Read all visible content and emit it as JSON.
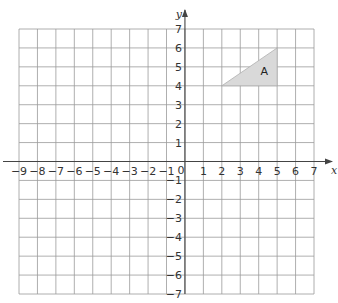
{
  "chart_data": {
    "type": "coordinate-grid",
    "x_axis": {
      "label": "x",
      "min": -9,
      "max": 7,
      "ticks": [
        -9,
        -8,
        -7,
        -6,
        -5,
        -4,
        -3,
        -2,
        -1,
        0,
        1,
        2,
        3,
        4,
        5,
        6,
        7
      ]
    },
    "y_axis": {
      "label": "y",
      "min": -7,
      "max": 7,
      "ticks": [
        -7,
        -6,
        -5,
        -4,
        -3,
        -2,
        -1,
        1,
        2,
        3,
        4,
        5,
        6,
        7
      ]
    },
    "origin_label": "0",
    "grid": true,
    "shapes": [
      {
        "name": "A",
        "type": "triangle",
        "vertices": [
          [
            2,
            4
          ],
          [
            5,
            4
          ],
          [
            5,
            6
          ]
        ],
        "fill": "#d9d9d9",
        "label_pos": [
          4.3,
          4.8
        ]
      }
    ]
  },
  "labels": {
    "x_axis": "x",
    "y_axis": "y",
    "origin": "0",
    "shape_a": "A"
  },
  "colors": {
    "grid": "#9a9a9a",
    "axis": "#444444",
    "shape_fill": "#d9d9d9",
    "shape_stroke": "#b0b0b0"
  }
}
